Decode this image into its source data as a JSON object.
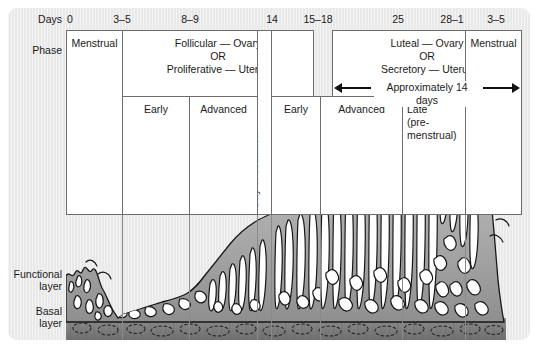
{
  "figure": {
    "row_labels": {
      "days": "Days",
      "phase": "Phase",
      "functional_layer": "Functional\nlayer",
      "basal_layer": "Basal\nlayer"
    },
    "day_ticks": [
      {
        "label": "0",
        "x": 70
      },
      {
        "label": "3–5",
        "x": 122
      },
      {
        "label": "8–9",
        "x": 190
      },
      {
        "label": "14",
        "x": 272
      },
      {
        "label": "15–18",
        "x": 318
      },
      {
        "label": "25",
        "x": 398
      },
      {
        "label": "28–1",
        "x": 452
      },
      {
        "label": "3–5",
        "x": 496
      }
    ],
    "phase_row": [
      {
        "name": "menstrual-early",
        "label": "Menstrual",
        "x": 0,
        "y": 0,
        "w": 57,
        "h": 185,
        "align": "center"
      },
      {
        "name": "follicular-proliferative",
        "label": "Follicular — Ovary\nOR\nProliferative — Uterus",
        "x": 56,
        "y": 0,
        "w": 192,
        "h": 67,
        "align": "center"
      },
      {
        "name": "luteal-secretory",
        "label": "Luteal — Ovary\nOR\nSecretory — Uterus",
        "x": 266,
        "y": 0,
        "w": 190,
        "h": 67,
        "align": "center"
      },
      {
        "name": "menstrual-late",
        "label": "Menstrual",
        "x": 399,
        "y": 0,
        "w": 57,
        "h": 185,
        "align": "center"
      }
    ],
    "approx_arrow": {
      "label": "Approximately 14 days",
      "x": 268,
      "y": 52,
      "w": 186
    },
    "ovulation_column": {
      "label": "Day of ovulation",
      "x": 191,
      "y": 0,
      "w": 15,
      "h": 185
    },
    "subphase_row": [
      {
        "name": "follicular-early",
        "label": "Early",
        "x": 56,
        "y": 66,
        "w": 68,
        "h": 119,
        "align": "center"
      },
      {
        "name": "follicular-advanced",
        "label": "Advanced",
        "x": 123,
        "y": 66,
        "w": 69,
        "h": 119,
        "align": "center"
      },
      {
        "name": "luteal-early",
        "label": "Early",
        "x": 205,
        "y": 66,
        "w": 50,
        "h": 119,
        "align": "center"
      },
      {
        "name": "luteal-advanced",
        "label": "Advanced",
        "x": 254,
        "y": 66,
        "w": 83,
        "h": 119,
        "align": "center"
      },
      {
        "name": "luteal-late",
        "label": "Late\n(pre-\nmenstrual)",
        "x": 336,
        "y": 66,
        "w": 64,
        "h": 119,
        "align": "left"
      }
    ],
    "gridlines_x": [
      56,
      123,
      191,
      205,
      254,
      336,
      399
    ],
    "colors": {
      "panel_background": "#e9e9e9",
      "box_background": "#ffffff",
      "box_border": "#6d6d6d",
      "text": "#1b1b1b",
      "gridline": "#8a8a8a",
      "tissue_stroke": "#111111",
      "functional_layer_fill": "#a8a8a8",
      "basal_layer_fill": "#7d7d7d",
      "gland_lumen": "#ffffff"
    }
  },
  "chart_data": {
    "type": "area",
    "xlabel": "Days",
    "ylabel": "Endometrial layers",
    "x_tick_labels": [
      "0",
      "3–5",
      "8–9",
      "14",
      "15–18",
      "25",
      "28–1",
      "3–5"
    ],
    "grid": true,
    "legend_position": "none",
    "series": [
      {
        "name": "Functional layer thickness (relative)",
        "x": [
          0,
          3,
          5,
          8,
          9,
          14,
          15,
          18,
          21,
          25,
          28,
          1,
          3,
          5
        ],
        "values": [
          12,
          4,
          4,
          10,
          14,
          36,
          46,
          66,
          78,
          84,
          86,
          78,
          30,
          10
        ]
      },
      {
        "name": "Basal layer thickness (relative)",
        "x": [
          0,
          3,
          5,
          8,
          9,
          14,
          15,
          18,
          21,
          25,
          28,
          1,
          3,
          5
        ],
        "values": [
          12,
          12,
          12,
          12,
          12,
          12,
          12,
          12,
          12,
          12,
          12,
          12,
          12,
          12
        ]
      }
    ],
    "annotations": [
      "Menstrual",
      "Follicular — Ovary OR Proliferative — Uterus",
      "Early",
      "Advanced",
      "Day of ovulation",
      "Luteal — Ovary OR Secretory — Uterus",
      "Approximately 14 days",
      "Late (pre-menstrual)",
      "Functional layer",
      "Basal layer"
    ]
  }
}
